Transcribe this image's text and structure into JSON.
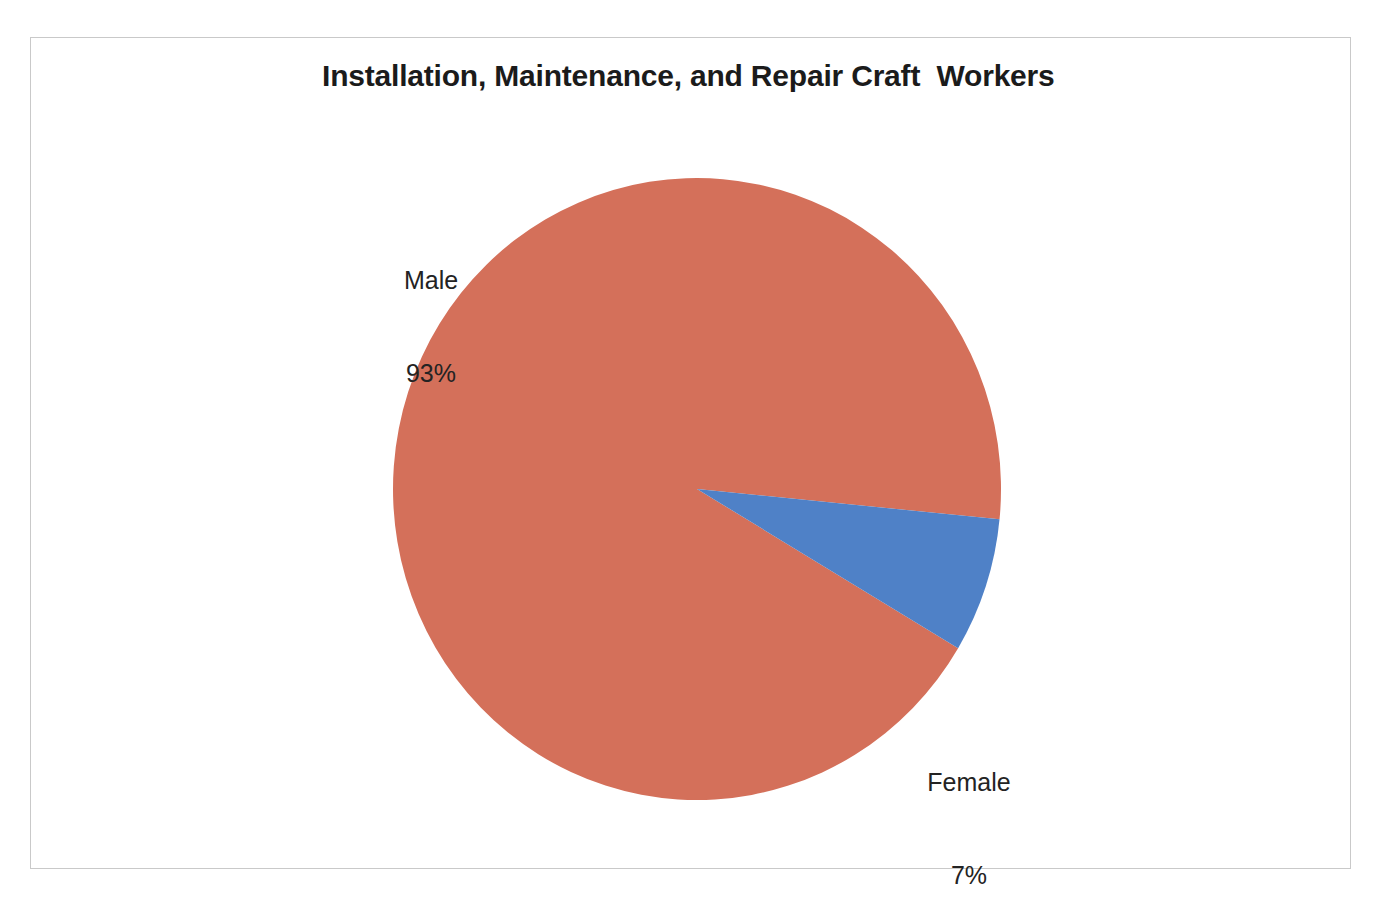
{
  "page": {
    "background_color": "#ffffff",
    "frame_border_color": "#c9c9c9"
  },
  "chart_data": {
    "type": "pie",
    "title": "Installation, Maintenance, and Repair Craft  Workers",
    "xlabel": "",
    "ylabel": "",
    "categories": [
      "Male",
      "Female"
    ],
    "values": [
      93,
      7
    ],
    "value_unit": "%",
    "labels": [
      "Male\n93%",
      "Female\n7%"
    ],
    "colors": [
      "#d4705a",
      "#4f81c7"
    ],
    "legend_position": "none",
    "grid": false,
    "start_angle_deg": 30.8,
    "direction": "clockwise",
    "slices": [
      {
        "name": "Male",
        "value": 93,
        "value_text": "93%",
        "color": "#d4705a",
        "start_angle_deg": 30.8,
        "sweep_deg": 334.8,
        "label_position": "upper-left"
      },
      {
        "name": "Female",
        "value": 7,
        "value_text": "7%",
        "color": "#4f81c7",
        "start_angle_deg": 25.2,
        "sweep_deg": 25.2,
        "label_position": "lower-right"
      }
    ]
  },
  "labels": {
    "male": {
      "name": "Male",
      "value": "93%"
    },
    "female": {
      "name": "Female",
      "value": "7%"
    }
  }
}
